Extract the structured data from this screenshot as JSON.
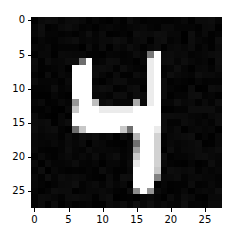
{
  "figure": {
    "background_color": "#ffffff",
    "plot_background_color": "#000000",
    "width_px": 239,
    "height_px": 242
  },
  "chart_data": {
    "type": "heatmap",
    "title": "",
    "subtitle": "",
    "xlabel": "",
    "ylabel": "",
    "colormap": "gray",
    "grid": false,
    "legend": null,
    "annotations": [],
    "depicts": "handwritten digit 4",
    "rows": 28,
    "cols": 28,
    "value_range": [
      0,
      255
    ],
    "xlim": [
      -0.5,
      27.5
    ],
    "ylim": [
      27.5,
      -0.5
    ],
    "xticks": [
      "0",
      "5",
      "10",
      "15",
      "20",
      "25"
    ],
    "yticks": [
      "0",
      "5",
      "10",
      "15",
      "20",
      "25"
    ],
    "xtick_values": [
      0,
      5,
      10,
      15,
      20,
      25
    ],
    "ytick_values": [
      0,
      5,
      10,
      15,
      20,
      25
    ],
    "pixels": [
      [
        0,
        0,
        0,
        0,
        0,
        0,
        0,
        0,
        0,
        0,
        0,
        0,
        0,
        0,
        0,
        0,
        0,
        0,
        0,
        0,
        0,
        0,
        0,
        0,
        0,
        0,
        0,
        0
      ],
      [
        0,
        0,
        0,
        0,
        0,
        0,
        0,
        0,
        0,
        0,
        0,
        0,
        0,
        0,
        0,
        0,
        0,
        0,
        0,
        0,
        0,
        0,
        0,
        0,
        0,
        0,
        0,
        0
      ],
      [
        0,
        0,
        0,
        0,
        0,
        0,
        0,
        0,
        0,
        0,
        0,
        0,
        0,
        0,
        0,
        0,
        0,
        0,
        0,
        0,
        0,
        0,
        0,
        0,
        0,
        0,
        0,
        0
      ],
      [
        0,
        0,
        0,
        0,
        0,
        0,
        0,
        0,
        0,
        0,
        0,
        0,
        0,
        0,
        0,
        0,
        0,
        0,
        0,
        0,
        0,
        0,
        0,
        0,
        0,
        0,
        0,
        0
      ],
      [
        0,
        0,
        0,
        0,
        0,
        0,
        0,
        0,
        0,
        0,
        0,
        0,
        0,
        0,
        0,
        0,
        0,
        0,
        0,
        0,
        0,
        0,
        0,
        0,
        0,
        0,
        0,
        0
      ],
      [
        0,
        0,
        0,
        0,
        0,
        0,
        0,
        0,
        0,
        0,
        0,
        0,
        0,
        0,
        0,
        0,
        0,
        120,
        255,
        0,
        0,
        0,
        0,
        0,
        0,
        0,
        0,
        0
      ],
      [
        0,
        0,
        0,
        0,
        0,
        0,
        0,
        110,
        255,
        0,
        0,
        0,
        0,
        0,
        0,
        0,
        0,
        236,
        255,
        0,
        0,
        0,
        0,
        0,
        0,
        0,
        0,
        0
      ],
      [
        0,
        0,
        0,
        0,
        0,
        0,
        255,
        255,
        255,
        0,
        0,
        0,
        0,
        0,
        0,
        0,
        0,
        236,
        255,
        0,
        0,
        0,
        0,
        0,
        0,
        0,
        0,
        0
      ],
      [
        0,
        0,
        0,
        0,
        0,
        0,
        255,
        255,
        255,
        0,
        0,
        0,
        0,
        0,
        0,
        0,
        0,
        236,
        255,
        0,
        0,
        0,
        0,
        0,
        0,
        0,
        0,
        0
      ],
      [
        0,
        0,
        0,
        0,
        0,
        0,
        255,
        255,
        255,
        0,
        0,
        0,
        0,
        0,
        0,
        0,
        0,
        236,
        255,
        0,
        0,
        0,
        0,
        0,
        0,
        0,
        0,
        0
      ],
      [
        0,
        0,
        0,
        0,
        0,
        0,
        255,
        255,
        255,
        0,
        0,
        0,
        0,
        0,
        0,
        0,
        0,
        236,
        255,
        0,
        0,
        0,
        0,
        0,
        0,
        0,
        0,
        0
      ],
      [
        0,
        0,
        0,
        0,
        0,
        0,
        255,
        255,
        255,
        0,
        0,
        0,
        0,
        0,
        0,
        0,
        0,
        236,
        255,
        0,
        0,
        0,
        0,
        0,
        0,
        0,
        0,
        0
      ],
      [
        0,
        0,
        0,
        0,
        0,
        0,
        150,
        255,
        255,
        190,
        0,
        0,
        0,
        0,
        0,
        170,
        0,
        236,
        255,
        0,
        0,
        0,
        0,
        0,
        0,
        0,
        0,
        0
      ],
      [
        0,
        0,
        0,
        0,
        0,
        0,
        200,
        255,
        255,
        255,
        235,
        235,
        235,
        235,
        235,
        255,
        255,
        255,
        255,
        0,
        0,
        0,
        0,
        0,
        0,
        0,
        0,
        0
      ],
      [
        0,
        0,
        0,
        0,
        0,
        0,
        255,
        255,
        255,
        255,
        255,
        255,
        255,
        255,
        255,
        255,
        255,
        255,
        255,
        0,
        0,
        0,
        0,
        0,
        0,
        0,
        0,
        0
      ],
      [
        0,
        0,
        0,
        0,
        0,
        0,
        255,
        255,
        255,
        255,
        255,
        255,
        255,
        255,
        255,
        255,
        255,
        255,
        255,
        0,
        0,
        0,
        0,
        0,
        0,
        0,
        0,
        0
      ],
      [
        0,
        0,
        0,
        0,
        0,
        0,
        110,
        200,
        255,
        255,
        255,
        255,
        255,
        200,
        110,
        255,
        255,
        255,
        235,
        0,
        0,
        0,
        0,
        0,
        0,
        0,
        0,
        0
      ],
      [
        0,
        0,
        0,
        0,
        0,
        0,
        0,
        0,
        0,
        0,
        0,
        0,
        0,
        0,
        0,
        180,
        255,
        255,
        210,
        0,
        0,
        0,
        0,
        0,
        0,
        0,
        0,
        0
      ],
      [
        0,
        0,
        0,
        0,
        0,
        0,
        0,
        0,
        0,
        0,
        0,
        0,
        0,
        0,
        0,
        110,
        255,
        255,
        210,
        0,
        0,
        0,
        0,
        0,
        0,
        0,
        0,
        0
      ],
      [
        0,
        0,
        0,
        0,
        0,
        0,
        0,
        0,
        0,
        0,
        0,
        0,
        0,
        0,
        0,
        160,
        255,
        255,
        210,
        0,
        0,
        0,
        0,
        0,
        0,
        0,
        0,
        0
      ],
      [
        0,
        0,
        0,
        0,
        0,
        0,
        0,
        0,
        0,
        0,
        0,
        0,
        0,
        0,
        0,
        200,
        255,
        255,
        210,
        0,
        0,
        0,
        0,
        0,
        0,
        0,
        0,
        0
      ],
      [
        0,
        0,
        0,
        0,
        0,
        0,
        0,
        0,
        0,
        0,
        0,
        0,
        0,
        0,
        0,
        235,
        255,
        255,
        210,
        0,
        0,
        0,
        0,
        0,
        0,
        0,
        0,
        0
      ],
      [
        0,
        0,
        0,
        0,
        0,
        0,
        0,
        0,
        0,
        0,
        0,
        0,
        0,
        0,
        0,
        255,
        255,
        255,
        200,
        0,
        0,
        0,
        0,
        0,
        0,
        0,
        0,
        0
      ],
      [
        0,
        0,
        0,
        0,
        0,
        0,
        0,
        0,
        0,
        0,
        0,
        0,
        0,
        0,
        0,
        255,
        255,
        255,
        130,
        0,
        0,
        0,
        0,
        0,
        0,
        0,
        0,
        0
      ],
      [
        0,
        0,
        0,
        0,
        0,
        0,
        0,
        0,
        0,
        0,
        0,
        0,
        0,
        0,
        0,
        255,
        255,
        255,
        0,
        0,
        0,
        0,
        0,
        0,
        0,
        0,
        0,
        0
      ],
      [
        0,
        0,
        0,
        0,
        0,
        0,
        0,
        0,
        0,
        0,
        0,
        0,
        0,
        0,
        0,
        140,
        255,
        150,
        0,
        0,
        0,
        0,
        0,
        0,
        0,
        0,
        0,
        0
      ],
      [
        0,
        0,
        0,
        0,
        0,
        0,
        0,
        0,
        0,
        0,
        0,
        0,
        0,
        0,
        0,
        0,
        0,
        0,
        0,
        0,
        0,
        0,
        0,
        0,
        0,
        0,
        0,
        0
      ],
      [
        0,
        0,
        0,
        0,
        0,
        0,
        0,
        0,
        0,
        0,
        0,
        0,
        0,
        0,
        0,
        0,
        0,
        0,
        0,
        0,
        0,
        0,
        0,
        0,
        0,
        0,
        0,
        0
      ]
    ]
  }
}
